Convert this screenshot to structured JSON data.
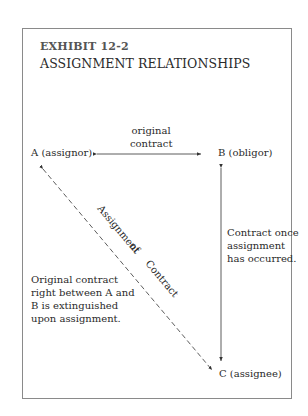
{
  "exhibit": {
    "number": "EXHIBIT 12-2",
    "title": "ASSIGNMENT RELATIONSHIPS"
  },
  "nodes": {
    "a": "A (assignor)",
    "b": "B (obligor)",
    "c": "C (assignee)"
  },
  "edges": {
    "ab_label": "original contract",
    "ac_label_1": "Assignment",
    "ac_label_2": "of",
    "ac_label_3": "Contract",
    "bc_label": "Contract once\nassignment\nhas occurred."
  },
  "notes": {
    "extinguished": "Original contract\nright between A and\nB is extinguished\nupon assignment."
  },
  "colors": {
    "frame": "#8a8a8a",
    "text": "#2a2a2a",
    "lines": "#333333"
  }
}
